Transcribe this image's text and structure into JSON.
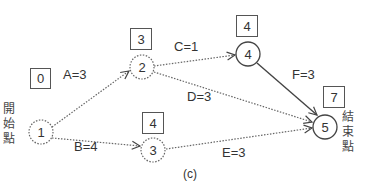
{
  "diagram": {
    "caption": "(c)",
    "start_label": [
      "開",
      "始",
      "點"
    ],
    "end_label": [
      "結",
      "束",
      "點"
    ],
    "nodes": [
      {
        "id": "1",
        "label": "1",
        "earliest_time": "0",
        "style": "dotted"
      },
      {
        "id": "2",
        "label": "2",
        "earliest_time": "3",
        "style": "dotted"
      },
      {
        "id": "3",
        "label": "3",
        "earliest_time": "4",
        "style": "dotted"
      },
      {
        "id": "4",
        "label": "4",
        "earliest_time": "4",
        "style": "solid"
      },
      {
        "id": "5",
        "label": "5",
        "earliest_time": "7",
        "style": "solid"
      }
    ],
    "edges": [
      {
        "from": "1",
        "to": "2",
        "label": "A=3",
        "style": "dotted"
      },
      {
        "from": "1",
        "to": "3",
        "label": "B=4",
        "style": "dotted"
      },
      {
        "from": "2",
        "to": "4",
        "label": "C=1",
        "style": "dotted"
      },
      {
        "from": "2",
        "to": "5",
        "label": "D=3",
        "style": "dotted"
      },
      {
        "from": "3",
        "to": "5",
        "label": "E=3",
        "style": "dotted"
      },
      {
        "from": "4",
        "to": "5",
        "label": "F=3",
        "style": "solid"
      }
    ]
  },
  "colors": {
    "line": "#555555",
    "text": "#333333",
    "background": "#ffffff"
  }
}
